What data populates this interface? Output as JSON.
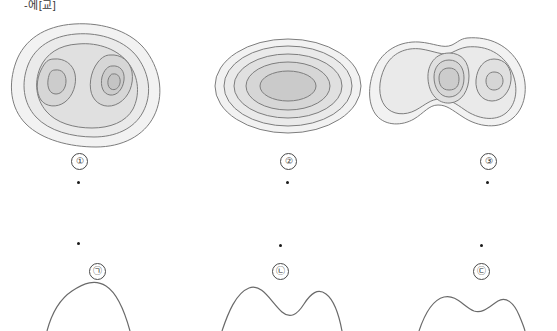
{
  "page": {
    "corner_text": "-에[교]",
    "background": "#ffffff"
  },
  "contour_colors": {
    "stroke": "#7d7d7d",
    "band_1": "#f2f2f2",
    "band_2": "#eaeaea",
    "band_3": "#e0e0e0",
    "band_4": "#d6d6d6",
    "band_5": "#cccccc"
  },
  "top_row": {
    "figures": [
      {
        "id": "contour-map-1",
        "label": "①",
        "description": "two-peak closed contour map, rounded blob outline"
      },
      {
        "id": "contour-map-2",
        "label": "②",
        "description": "single elongated elliptical concentric contour map"
      },
      {
        "id": "contour-map-3",
        "label": "③",
        "description": "two-peak contour map with pinched waist"
      }
    ]
  },
  "bottom_row": {
    "figures": [
      {
        "id": "profile-curve-1",
        "label": "㉠",
        "description": "single broad hump profile curve"
      },
      {
        "id": "profile-curve-2",
        "label": "㉡",
        "description": "double hump profile curve with deep middle dip"
      },
      {
        "id": "profile-curve-3",
        "label": "㉢",
        "description": "double hump profile curve with shallow middle dip"
      }
    ]
  },
  "markers": {
    "dot_count": 6,
    "dot_color": "#1a1a1a"
  }
}
